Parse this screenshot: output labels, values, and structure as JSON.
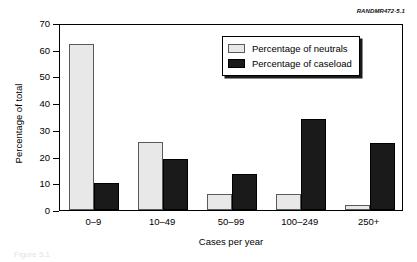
{
  "source_id": "RANDMR472-5.1",
  "caption_sliver": "Figure 5.1",
  "legend": {
    "position": "top-right-inside",
    "entries": [
      {
        "label": "Percentage of neutrals",
        "color": "#e8e8e8"
      },
      {
        "label": "Percentage of caseload",
        "color": "#1a1a1a"
      }
    ]
  },
  "chart_data": {
    "type": "bar",
    "title": "",
    "subtitle": "",
    "xlabel": "Cases per year",
    "ylabel": "Percentage of total",
    "categories": [
      "0–9",
      "10–49",
      "50–99",
      "100–249",
      "250+"
    ],
    "series": [
      {
        "name": "Percentage of neutrals",
        "color": "#e8e8e8",
        "values": [
          62,
          25.5,
          6,
          6,
          2
        ]
      },
      {
        "name": "Percentage of caseload",
        "color": "#1a1a1a",
        "values": [
          10,
          19,
          13.6,
          34,
          25
        ]
      }
    ],
    "ylim": [
      0,
      70
    ],
    "yticks": [
      0,
      10,
      20,
      30,
      40,
      50,
      60,
      70
    ],
    "ytick_labels": [
      "0",
      "10",
      "20",
      "30",
      "40",
      "50",
      "60",
      "70"
    ],
    "grid": false,
    "legend_position": "upper right"
  }
}
